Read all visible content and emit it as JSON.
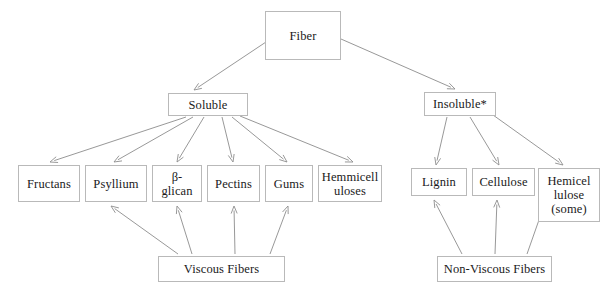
{
  "diagram": {
    "stroke_color": "#8c8c8c",
    "box_border_color": "#b9b9b9",
    "text_color": "#1a1a1a",
    "background": "#ffffff",
    "nodes": {
      "fiber": {
        "label": "Fiber",
        "x": 265,
        "y": 11,
        "w": 76,
        "h": 49
      },
      "soluble": {
        "label": "Soluble",
        "x": 168,
        "y": 93,
        "w": 80,
        "h": 23
      },
      "insoluble": {
        "label": "Insoluble*",
        "x": 424,
        "y": 92,
        "w": 72,
        "h": 24
      },
      "fructans": {
        "label": "Fructans",
        "x": 18,
        "y": 165,
        "w": 62,
        "h": 37
      },
      "psyllium": {
        "label": "Psyllium",
        "x": 85,
        "y": 165,
        "w": 62,
        "h": 37
      },
      "beta_glican": {
        "label": "β-\nglican",
        "x": 152,
        "y": 165,
        "w": 50,
        "h": 37
      },
      "pectins": {
        "label": "Pectins",
        "x": 207,
        "y": 165,
        "w": 53,
        "h": 37
      },
      "gums": {
        "label": "Gums",
        "x": 265,
        "y": 165,
        "w": 48,
        "h": 37
      },
      "hemmicelluloses": {
        "label": "Hemmicell\nuloses",
        "x": 318,
        "y": 165,
        "w": 64,
        "h": 37
      },
      "lignin": {
        "label": "Lignin",
        "x": 411,
        "y": 168,
        "w": 56,
        "h": 28
      },
      "cellulose": {
        "label": "Cellulose",
        "x": 472,
        "y": 168,
        "w": 63,
        "h": 28
      },
      "hemicellulose_some": {
        "label": "Hemicel\nlulose\n(some)",
        "x": 538,
        "y": 168,
        "w": 62,
        "h": 54
      },
      "viscous_fibers": {
        "label": "Viscous Fibers",
        "x": 158,
        "y": 256,
        "w": 127,
        "h": 26
      },
      "non_viscous_fibers": {
        "label": "Non-Viscous Fibers",
        "x": 437,
        "y": 256,
        "w": 115,
        "h": 26
      }
    },
    "edges": [
      {
        "name": "fiber-to-soluble",
        "from": "fiber",
        "to": "soluble",
        "x1": 266,
        "y1": 42,
        "x2": 194,
        "y2": 90
      },
      {
        "name": "fiber-to-insoluble",
        "from": "fiber",
        "to": "insoluble",
        "x1": 341,
        "y1": 39,
        "x2": 455,
        "y2": 89
      },
      {
        "name": "soluble-to-fructans",
        "from": "soluble",
        "to": "fructans",
        "x1": 186,
        "y1": 117,
        "x2": 50,
        "y2": 162
      },
      {
        "name": "soluble-to-psyllium",
        "from": "soluble",
        "to": "psyllium",
        "x1": 193,
        "y1": 117,
        "x2": 114,
        "y2": 162
      },
      {
        "name": "soluble-to-beta-glican",
        "from": "soluble",
        "to": "beta_glican",
        "x1": 204,
        "y1": 117,
        "x2": 177,
        "y2": 162
      },
      {
        "name": "soluble-to-pectins",
        "from": "soluble",
        "to": "pectins",
        "x1": 222,
        "y1": 117,
        "x2": 233,
        "y2": 162
      },
      {
        "name": "soluble-to-gums",
        "from": "soluble",
        "to": "gums",
        "x1": 232,
        "y1": 117,
        "x2": 287,
        "y2": 162
      },
      {
        "name": "soluble-to-hemmicelluloses",
        "from": "soluble",
        "to": "hemmicelluloses",
        "x1": 240,
        "y1": 116,
        "x2": 353,
        "y2": 162
      },
      {
        "name": "insoluble-to-lignin",
        "from": "insoluble",
        "to": "lignin",
        "x1": 447,
        "y1": 117,
        "x2": 436,
        "y2": 165
      },
      {
        "name": "insoluble-to-cellulose",
        "from": "insoluble",
        "to": "cellulose",
        "x1": 470,
        "y1": 117,
        "x2": 499,
        "y2": 165
      },
      {
        "name": "insoluble-to-hemicellulose-some",
        "from": "insoluble",
        "to": "hemicellulose_some",
        "x1": 493,
        "y1": 115,
        "x2": 563,
        "y2": 165
      },
      {
        "name": "viscous-to-psyllium",
        "from": "viscous_fibers",
        "to": "psyllium",
        "x1": 178,
        "y1": 254,
        "x2": 111,
        "y2": 206
      },
      {
        "name": "viscous-to-beta-glican",
        "from": "viscous_fibers",
        "to": "beta_glican",
        "x1": 192,
        "y1": 254,
        "x2": 177,
        "y2": 206
      },
      {
        "name": "viscous-to-pectins",
        "from": "viscous_fibers",
        "to": "pectins",
        "x1": 235,
        "y1": 254,
        "x2": 234,
        "y2": 206
      },
      {
        "name": "viscous-to-gums",
        "from": "viscous_fibers",
        "to": "gums",
        "x1": 270,
        "y1": 254,
        "x2": 288,
        "y2": 206
      },
      {
        "name": "non-viscous-to-lignin",
        "from": "non_viscous_fibers",
        "to": "lignin",
        "x1": 462,
        "y1": 254,
        "x2": 434,
        "y2": 200
      },
      {
        "name": "non-viscous-to-cellulose",
        "from": "non_viscous_fibers",
        "to": "cellulose",
        "x1": 495,
        "y1": 254,
        "x2": 497,
        "y2": 200
      },
      {
        "name": "non-viscous-to-hemicellulose-some",
        "from": "non_viscous_fibers",
        "to": "hemicellulose_some",
        "x1": 527,
        "y1": 254,
        "x2": 546,
        "y2": 200
      }
    ]
  }
}
